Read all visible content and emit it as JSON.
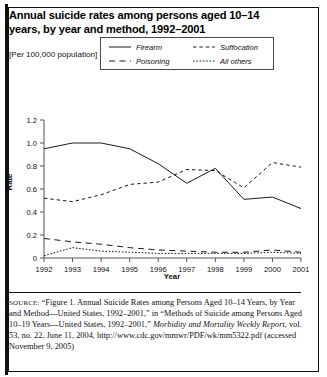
{
  "figure": {
    "title": "Annual suicide rates among persons aged 10–14 years, by year and method, 1992–2001",
    "subtitle": "[Per 100,000 population]",
    "source_label": "SOURCE:",
    "source_part1": " “Figure 1. Annual Suicide Rates among Persons Aged 10–14 Years, by Year and Method—United States, 1992–2001,” in “Methods of Suicide among Persons Aged 10–19 Years—United States, 1992–2001,” ",
    "source_italic": "Morbidity and Mortality Weekly Report",
    "source_part2": ", vol. 53, no. 22, June 11, 2004, http://www.cdc.gov/mmwr/PDF/wk/mm5322.pdf (accessed November 9, 2005)"
  },
  "chart_data": {
    "type": "line",
    "title": "Annual suicide rates among persons aged 10–14 years, by year and method, 1992–2001",
    "xlabel": "Year",
    "ylabel": "Rate",
    "unit_note": "[Per 100,000 population]",
    "categories": [
      "1992",
      "1993",
      "1994",
      "1995",
      "1996",
      "1997",
      "1998",
      "1999",
      "2000",
      "2001"
    ],
    "x": [
      1992,
      1993,
      1994,
      1995,
      1996,
      1997,
      1998,
      1999,
      2000,
      2001
    ],
    "xlim": [
      1992,
      2001
    ],
    "ylim": [
      0,
      1.2
    ],
    "yticks": [
      "0",
      "0.2",
      "0.4",
      "0.6",
      "0.8",
      "1.0",
      "1.2"
    ],
    "ytick_values": [
      0,
      0.2,
      0.4,
      0.6,
      0.8,
      1.0,
      1.2
    ],
    "grid": false,
    "legend_position": "top-center",
    "series": [
      {
        "name": "Firearm",
        "style": "solid",
        "color": "#1a1a1a",
        "values": [
          0.95,
          1.0,
          1.0,
          0.95,
          0.82,
          0.65,
          0.78,
          0.51,
          0.53,
          0.43
        ]
      },
      {
        "name": "Suffocation",
        "style": "dashed-short",
        "color": "#1a1a1a",
        "values": [
          0.52,
          0.49,
          0.55,
          0.64,
          0.66,
          0.77,
          0.76,
          0.61,
          0.83,
          0.79
        ]
      },
      {
        "name": "Poisoning",
        "style": "dashed-long",
        "color": "#1a1a1a",
        "values": [
          0.17,
          0.14,
          0.12,
          0.09,
          0.07,
          0.06,
          0.05,
          0.05,
          0.07,
          0.05
        ]
      },
      {
        "name": "All others",
        "style": "dotted",
        "color": "#1a1a1a",
        "values": [
          0.02,
          0.09,
          0.06,
          0.05,
          0.04,
          0.04,
          0.04,
          0.04,
          0.05,
          0.04
        ]
      }
    ]
  }
}
